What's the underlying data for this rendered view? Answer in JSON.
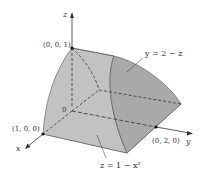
{
  "axes": {
    "x": "x",
    "y": "y",
    "z": "z"
  },
  "points": {
    "origin": "0",
    "z_top": "(0, 0, 1)",
    "x_one": "(1, 0, 0)",
    "y_two": "(0, 2, 0)"
  },
  "surfaces": {
    "plane": "y = 2 − z",
    "cylinder": "z = 1 − x²"
  },
  "colors": {
    "surface_fill": "#b3b3b3",
    "surface_fill_light": "#c8c8c8",
    "surface_fill_dark": "#a6a6a6",
    "line": "#333333"
  }
}
